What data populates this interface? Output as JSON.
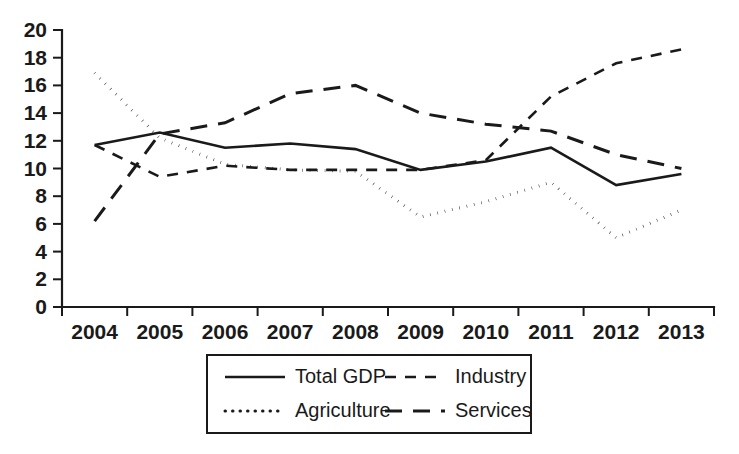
{
  "chart_data": {
    "type": "line",
    "title": "",
    "xlabel": "",
    "ylabel": "",
    "x": [
      2004,
      2005,
      2006,
      2007,
      2008,
      2009,
      2010,
      2011,
      2012,
      2013
    ],
    "categories": [
      "2004",
      "2005",
      "2006",
      "2007",
      "2008",
      "2009",
      "2010",
      "2011",
      "2012",
      "2013"
    ],
    "ylim": [
      0,
      20
    ],
    "yticks": [
      0,
      2,
      4,
      6,
      8,
      10,
      12,
      14,
      16,
      18,
      20
    ],
    "ytick_labels": [
      "0",
      "2",
      "4",
      "6",
      "8",
      "10",
      "12",
      "14",
      "16",
      "18",
      "20"
    ],
    "grid": false,
    "legend_position": "bottom-center",
    "series": [
      {
        "name": "Total GDP",
        "style": "solid",
        "color": "#1a1a1a",
        "values": [
          11.7,
          12.6,
          11.5,
          11.8,
          11.4,
          9.9,
          10.5,
          11.5,
          8.8,
          9.6
        ]
      },
      {
        "name": "Industry",
        "style": "dashed-short",
        "color": "#1a1a1a",
        "values": [
          11.7,
          9.4,
          10.2,
          9.9,
          9.9,
          9.9,
          10.6,
          15.2,
          17.6,
          18.6
        ]
      },
      {
        "name": "Agriculture",
        "style": "dotted",
        "color": "#1a1a1a",
        "values": [
          16.9,
          12.2,
          10.3,
          9.9,
          9.8,
          6.5,
          7.6,
          9.0,
          5.0,
          7.0
        ]
      },
      {
        "name": "Services",
        "style": "dashed-long",
        "color": "#1a1a1a",
        "values": [
          6.2,
          12.5,
          13.3,
          15.4,
          16.0,
          14.0,
          13.2,
          12.7,
          11.0,
          10.0
        ]
      }
    ]
  },
  "legend": {
    "entries": [
      {
        "label": "Total GDP",
        "style": "solid"
      },
      {
        "label": "Industry",
        "style": "dashed-short"
      },
      {
        "label": "Agriculture",
        "style": "dotted"
      },
      {
        "label": "Services",
        "style": "dashed-long"
      }
    ]
  }
}
